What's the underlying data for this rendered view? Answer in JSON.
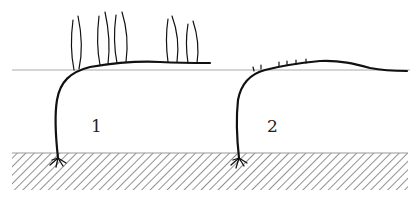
{
  "diagram": {
    "type": "plant-layering-illustration",
    "labels": [
      {
        "id": "1",
        "text": "1"
      },
      {
        "id": "2",
        "text": "2"
      }
    ],
    "colors": {
      "stem": "#111111",
      "ground_line": "#aaaaaa",
      "hatch": "#666666",
      "background": "#ffffff"
    },
    "plants": [
      {
        "id": "plant-1",
        "description": "stem rooted in soil, bent horizontally along surface with upright shoots",
        "shoots": 10
      },
      {
        "id": "plant-2",
        "description": "stem rooted in soil, bent horizontally along surface with small buds",
        "buds": 6
      }
    ]
  }
}
